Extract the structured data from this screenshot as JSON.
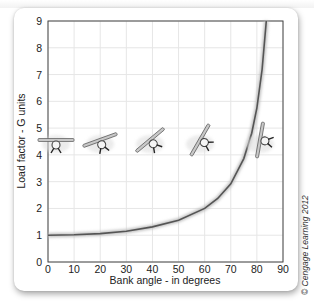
{
  "chart_data": {
    "type": "line",
    "title": "",
    "xlabel": "Bank angle - in degrees",
    "ylabel": "Load factor - G units",
    "xlim": [
      0,
      90
    ],
    "ylim": [
      0,
      9
    ],
    "x_ticks": [
      "0",
      "10",
      "20",
      "30",
      "40",
      "50",
      "60",
      "70",
      "80",
      "90"
    ],
    "y_ticks": [
      "0",
      "1",
      "2",
      "3",
      "4",
      "5",
      "6",
      "7",
      "8",
      "9"
    ],
    "grid": true,
    "legend": null,
    "series": [
      {
        "name": "Load factor vs bank angle",
        "x": [
          0,
          10,
          20,
          30,
          40,
          50,
          60,
          65,
          70,
          75,
          78,
          80,
          82,
          83.6
        ],
        "y": [
          1.0,
          1.02,
          1.06,
          1.15,
          1.31,
          1.56,
          2.0,
          2.37,
          2.92,
          3.86,
          4.81,
          5.76,
          7.19,
          9.0
        ]
      }
    ],
    "annotations": [
      {
        "type": "airplane-front-view-icon",
        "bank_angle": 0
      },
      {
        "type": "airplane-front-view-icon",
        "bank_angle": 20
      },
      {
        "type": "airplane-front-view-icon",
        "bank_angle": 40
      },
      {
        "type": "airplane-front-view-icon",
        "bank_angle": 60
      },
      {
        "type": "airplane-front-view-icon",
        "bank_angle": 80
      }
    ]
  },
  "credit": "© Cengage Learning 2012",
  "colors": {
    "curve": "#555555",
    "grid": "#e6e6e6",
    "axis": "#444444",
    "text": "#222222"
  }
}
